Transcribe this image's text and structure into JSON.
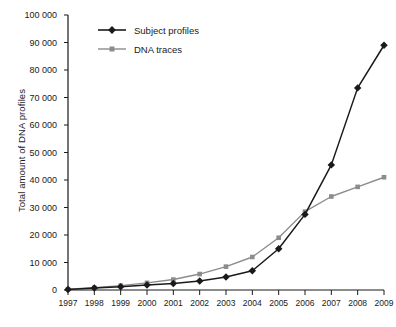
{
  "chart_data": {
    "type": "line",
    "title": "",
    "xlabel": "",
    "ylabel": "Total amount of DNA profiles",
    "categories": [
      "1997",
      "1998",
      "1999",
      "2000",
      "2001",
      "2002",
      "2003",
      "2004",
      "2005",
      "2006",
      "2007",
      "2008",
      "2009"
    ],
    "xlim": [
      "1997",
      "2009"
    ],
    "ylim": [
      0,
      100000
    ],
    "ytick_labels": [
      "0",
      "10 000",
      "20 000",
      "30 000",
      "40 000",
      "50 000",
      "60 000",
      "70 000",
      "80 000",
      "90 000",
      "100 000"
    ],
    "ytick_values": [
      0,
      10000,
      20000,
      30000,
      40000,
      50000,
      60000,
      70000,
      80000,
      90000,
      100000
    ],
    "grid": false,
    "legend_position": "top-left",
    "series": [
      {
        "name": "Subject profiles",
        "color": "#1a1a1a",
        "marker": "diamond",
        "values": [
          200,
          700,
          1200,
          1800,
          2400,
          3300,
          4700,
          7000,
          15000,
          27500,
          45500,
          73500,
          89000
        ]
      },
      {
        "name": "DNA traces",
        "color": "#8c8c8c",
        "marker": "square",
        "values": [
          300,
          800,
          1600,
          2600,
          3800,
          5800,
          8500,
          12000,
          19000,
          28500,
          34000,
          37500,
          41000
        ]
      }
    ]
  }
}
